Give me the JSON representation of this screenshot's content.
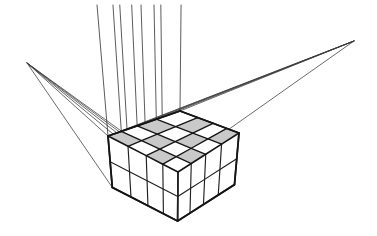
{
  "figure": {
    "title": "Three-point perspective cube grid construction",
    "canvas": {
      "width": 377,
      "height": 236,
      "background": "#ffffff"
    },
    "colors": {
      "line_heavy": "#151515",
      "line_medium": "#202020",
      "construction_ray": "#3a3a3a",
      "vertical_ray": "#4a4a4a",
      "cell_shade": "#c9c9c9",
      "paper": "#ffffff"
    },
    "vanishing_points": [
      {
        "name": "left-vanishing-point",
        "label": "VPL",
        "x": 27,
        "y": 63
      },
      {
        "name": "right-vanishing-point",
        "label": "VPR",
        "x": 354,
        "y": 41
      },
      {
        "name": "vertical-vanishing-point",
        "label": "VPV",
        "x": 172,
        "y": 900
      }
    ],
    "grid": {
      "columns": 4,
      "rows": 4,
      "depth_levels": 2,
      "top_face_corners": {
        "left": {
          "x": 108,
          "y": 136
        },
        "back": {
          "x": 180,
          "y": 111
        },
        "right": {
          "x": 239,
          "y": 133
        },
        "front": {
          "x": 178,
          "y": 172
        }
      },
      "bottom_front_vertex": {
        "x": 178,
        "y": 221
      },
      "shaded_cells": [
        [
          0,
          1
        ],
        [
          0,
          3
        ],
        [
          1,
          0
        ],
        [
          1,
          2
        ],
        [
          2,
          1
        ],
        [
          2,
          3
        ],
        [
          3,
          0
        ],
        [
          3,
          2
        ]
      ]
    },
    "construction_rays": {
      "left_count": 6,
      "right_count": 6,
      "vertical_count": 8,
      "vertical_top_y": 5
    }
  }
}
